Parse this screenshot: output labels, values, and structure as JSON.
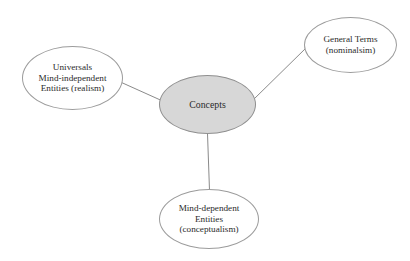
{
  "diagram": {
    "type": "concept-map",
    "background_color": "#ffffff",
    "node_stroke_color": "#9c9c9c",
    "edge_color": "#8a8a8a",
    "text_color": "#2b2b2b",
    "center_fill_color": "#d7d7d7",
    "center": {
      "id": "concepts",
      "lines": [
        "Concepts"
      ]
    },
    "nodes": [
      {
        "id": "universals",
        "lines": [
          "Universals",
          "Mind-independent",
          "Entities (realism)"
        ]
      },
      {
        "id": "general-terms",
        "lines": [
          "General Terms",
          "(nominalsim)"
        ]
      },
      {
        "id": "mind-dependent",
        "lines": [
          "Mind-dependent",
          "Entities",
          "(conceptualism)"
        ]
      }
    ],
    "edges": [
      {
        "id": "edge-concepts-universals",
        "from": "concepts",
        "to": "universals"
      },
      {
        "id": "edge-concepts-general-terms",
        "from": "concepts",
        "to": "general-terms"
      },
      {
        "id": "edge-concepts-mind-dependent",
        "from": "concepts",
        "to": "mind-dependent"
      }
    ]
  }
}
